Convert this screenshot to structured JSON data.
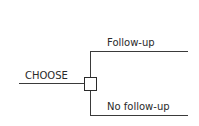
{
  "diagram": {
    "type": "decision-tree",
    "root": {
      "label": "CHOOSE",
      "node_shape": "square",
      "node_meaning": "decision node"
    },
    "branches": [
      {
        "label": "Follow-up"
      },
      {
        "label": "No follow-up"
      }
    ],
    "colors": {
      "line": "#3a3a3a",
      "text": "#2a2a2a",
      "background": "#ffffff"
    }
  }
}
